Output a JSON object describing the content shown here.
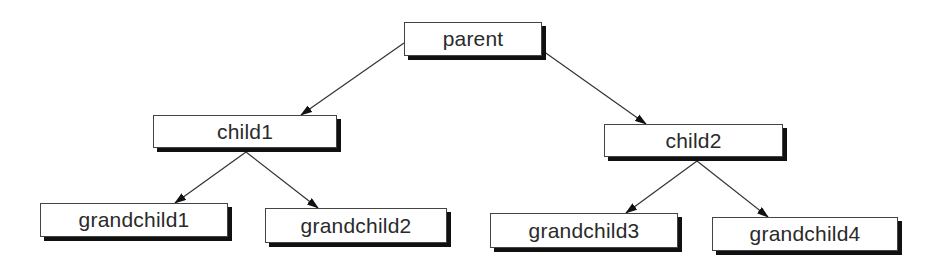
{
  "diagram": {
    "type": "tree",
    "nodes": [
      {
        "id": "parent",
        "label": "parent",
        "x": 404,
        "y": 22,
        "w": 138,
        "h": 34
      },
      {
        "id": "child1",
        "label": "child1",
        "x": 153,
        "y": 115,
        "w": 184,
        "h": 33
      },
      {
        "id": "child2",
        "label": "child2",
        "x": 604,
        "y": 124,
        "w": 179,
        "h": 33
      },
      {
        "id": "grandchild1",
        "label": "grandchild1",
        "x": 40,
        "y": 203,
        "w": 188,
        "h": 34
      },
      {
        "id": "grandchild2",
        "label": "grandchild2",
        "x": 265,
        "y": 208,
        "w": 182,
        "h": 35
      },
      {
        "id": "grandchild3",
        "label": "grandchild3",
        "x": 490,
        "y": 213,
        "w": 188,
        "h": 35
      },
      {
        "id": "grandchild4",
        "label": "grandchild4",
        "x": 712,
        "y": 217,
        "w": 186,
        "h": 34
      }
    ],
    "edges": [
      {
        "from": "parent",
        "to": "child1",
        "x1": 404,
        "y1": 43,
        "x2": 301,
        "y2": 115
      },
      {
        "from": "parent",
        "to": "child2",
        "x1": 543,
        "y1": 51,
        "x2": 646,
        "y2": 124
      },
      {
        "from": "child1",
        "to": "grandchild1",
        "x1": 246,
        "y1": 152,
        "x2": 175,
        "y2": 203
      },
      {
        "from": "child1",
        "to": "grandchild2",
        "x1": 246,
        "y1": 152,
        "x2": 318,
        "y2": 208
      },
      {
        "from": "child2",
        "to": "grandchild3",
        "x1": 697,
        "y1": 161,
        "x2": 626,
        "y2": 213
      },
      {
        "from": "child2",
        "to": "grandchild4",
        "x1": 697,
        "y1": 161,
        "x2": 768,
        "y2": 217
      }
    ]
  }
}
